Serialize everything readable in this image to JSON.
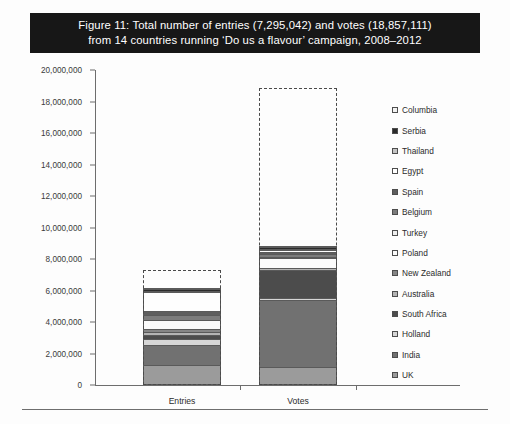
{
  "figure": {
    "title_line1": "Figure 11: Total number of entries (7,295,042) and votes (18,857,111)",
    "title_line2": "from 14 countries running ‘Do us a flavour’ campaign, 2008–2012"
  },
  "chart_data": {
    "type": "bar",
    "stacked": true,
    "title": "Figure 11: Total number of entries (7,295,042) and votes (18,857,111) from 14 countries running ‘Do us a flavour’ campaign, 2008–2012",
    "xlabel": "",
    "ylabel": "",
    "categories": [
      "Entries",
      "Votes"
    ],
    "ylim": [
      0,
      20000000
    ],
    "ytick_values": [
      0,
      2000000,
      4000000,
      6000000,
      8000000,
      10000000,
      12000000,
      14000000,
      16000000,
      18000000,
      20000000
    ],
    "ytick_labels": [
      "0",
      "2,000,000",
      "4,000,000",
      "6,000,000",
      "8,000,000",
      "10,000,000",
      "12,000,000",
      "14,000,000",
      "16,000,000",
      "18,000,000",
      "20,000,000"
    ],
    "grid": false,
    "legend_position": "right",
    "legend_order_top_to_bottom": [
      "Columbia",
      "Serbia",
      "Thailand",
      "Egypt",
      "Spain",
      "Belgium",
      "Turkey",
      "Poland",
      "New Zealand",
      "Australia",
      "South Africa",
      "Holland",
      "India",
      "UK"
    ],
    "totals": {
      "Entries": 7295042,
      "Votes": 18857111
    },
    "total_marker": "dashed outline rectangle drawn to the stated grand total above each stack",
    "series": [
      {
        "name": "UK",
        "color": "#9b9b9b",
        "values": [
          1250000,
          1150000
        ]
      },
      {
        "name": "India",
        "color": "#717171",
        "values": [
          1300000,
          4250000
        ]
      },
      {
        "name": "Holland",
        "color": "#d6d6d6",
        "values": [
          350000,
          150000
        ]
      },
      {
        "name": "South Africa",
        "color": "#4c4c4c",
        "values": [
          250000,
          1750000
        ]
      },
      {
        "name": "Australia",
        "color": "#b4b4b4",
        "values": [
          200000,
          100000
        ]
      },
      {
        "name": "New Zealand",
        "color": "#868686",
        "values": [
          200000,
          60000
        ]
      },
      {
        "name": "Poland",
        "color": "#fbfbfb",
        "values": [
          550000,
          600000
        ]
      },
      {
        "name": "Turkey",
        "color": "#ededed",
        "values": [
          50000,
          80000
        ]
      },
      {
        "name": "Belgium",
        "color": "#7c7c7c",
        "values": [
          300000,
          180000
        ]
      },
      {
        "name": "Spain",
        "color": "#5e5e5e",
        "values": [
          250000,
          120000
        ]
      },
      {
        "name": "Egypt",
        "color": "#fefefe",
        "values": [
          1200000,
          150000
        ]
      },
      {
        "name": "Thailand",
        "color": "#c4c4c4",
        "values": [
          50000,
          60000
        ]
      },
      {
        "name": "Serbia",
        "color": "#2b2b2b",
        "values": [
          120000,
          90000
        ]
      },
      {
        "name": "Columbia",
        "color": "#f2f2f2",
        "values": [
          40000,
          50000
        ]
      }
    ]
  },
  "axis": {
    "x_categories": [
      "Entries",
      "Votes"
    ]
  }
}
